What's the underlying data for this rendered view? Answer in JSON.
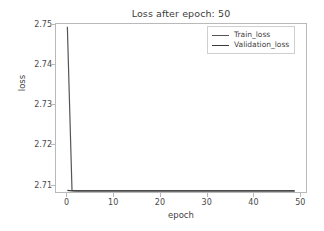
{
  "chart_data": {
    "type": "line",
    "title": "Loss after epoch: 50",
    "xlabel": "epoch",
    "ylabel": "loss",
    "xlim": [
      -2.45,
      51.45
    ],
    "ylim": [
      2.7079,
      2.7502
    ],
    "xticks": [
      0,
      10,
      20,
      30,
      40,
      50
    ],
    "xtick_labels": [
      "0",
      "10",
      "20",
      "30",
      "40",
      "50"
    ],
    "yticks": [
      2.71,
      2.72,
      2.73,
      2.74,
      2.75
    ],
    "ytick_labels": [
      "2.71",
      "2.72",
      "2.73",
      "2.74",
      "2.75"
    ],
    "grid": false,
    "legend_position": "upper right",
    "x": [
      0,
      1,
      2,
      3,
      4,
      5,
      6,
      7,
      8,
      9,
      10,
      11,
      12,
      13,
      14,
      15,
      16,
      17,
      18,
      19,
      20,
      21,
      22,
      23,
      24,
      25,
      26,
      27,
      28,
      29,
      30,
      31,
      32,
      33,
      34,
      35,
      36,
      37,
      38,
      39,
      40,
      41,
      42,
      43,
      44,
      45,
      46,
      47,
      48,
      49
    ],
    "series": [
      {
        "name": "Train_loss",
        "color": "#555555",
        "values": [
          2.7495,
          2.7083,
          2.7082,
          2.7082,
          2.7082,
          2.7082,
          2.7082,
          2.7082,
          2.7082,
          2.7082,
          2.7082,
          2.7082,
          2.7082,
          2.7082,
          2.7082,
          2.7082,
          2.7082,
          2.7082,
          2.7082,
          2.7082,
          2.7082,
          2.7082,
          2.7082,
          2.7082,
          2.7082,
          2.7082,
          2.7082,
          2.7082,
          2.7082,
          2.7082,
          2.7082,
          2.7082,
          2.7082,
          2.7082,
          2.7082,
          2.7082,
          2.7082,
          2.7082,
          2.7082,
          2.7082,
          2.7082,
          2.7082,
          2.7082,
          2.7082,
          2.7082,
          2.7082,
          2.7082,
          2.7082,
          2.7082,
          2.7082
        ]
      },
      {
        "name": "Validation_loss",
        "color": "#3a3a3a",
        "values": [
          2.7083,
          2.7082,
          2.7082,
          2.7082,
          2.7082,
          2.7082,
          2.7082,
          2.7082,
          2.7082,
          2.7082,
          2.7082,
          2.7082,
          2.7082,
          2.7082,
          2.7082,
          2.7082,
          2.7082,
          2.7082,
          2.7082,
          2.7082,
          2.7082,
          2.7082,
          2.7082,
          2.7082,
          2.7082,
          2.7082,
          2.7082,
          2.7082,
          2.7082,
          2.7082,
          2.7082,
          2.7082,
          2.7082,
          2.7082,
          2.7082,
          2.7082,
          2.7082,
          2.7082,
          2.7082,
          2.7082,
          2.7082,
          2.7082,
          2.7082,
          2.7082,
          2.7082,
          2.7082,
          2.7082,
          2.7082,
          2.7082,
          2.7082
        ]
      }
    ]
  },
  "legend": {
    "entries": [
      {
        "label": "Train_loss"
      },
      {
        "label": "Validation_loss"
      }
    ]
  }
}
